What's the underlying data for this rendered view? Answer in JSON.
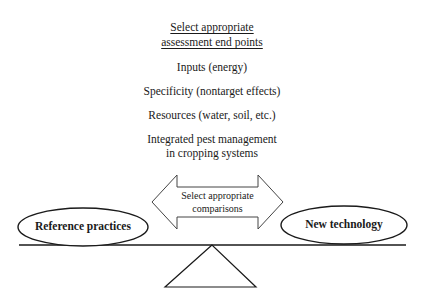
{
  "heading": {
    "line1": "Select appropriate",
    "line2": "assessment end points"
  },
  "end_points": [
    "Inputs (energy)",
    "Specificity (nontarget effects)",
    "Resources (water, soil, etc.)",
    "Integrated pest management",
    "in cropping systems"
  ],
  "arrow": {
    "line1": "Select appropriate",
    "line2": "comparisons"
  },
  "left_ellipse": "Reference practices",
  "right_ellipse": "New technology"
}
